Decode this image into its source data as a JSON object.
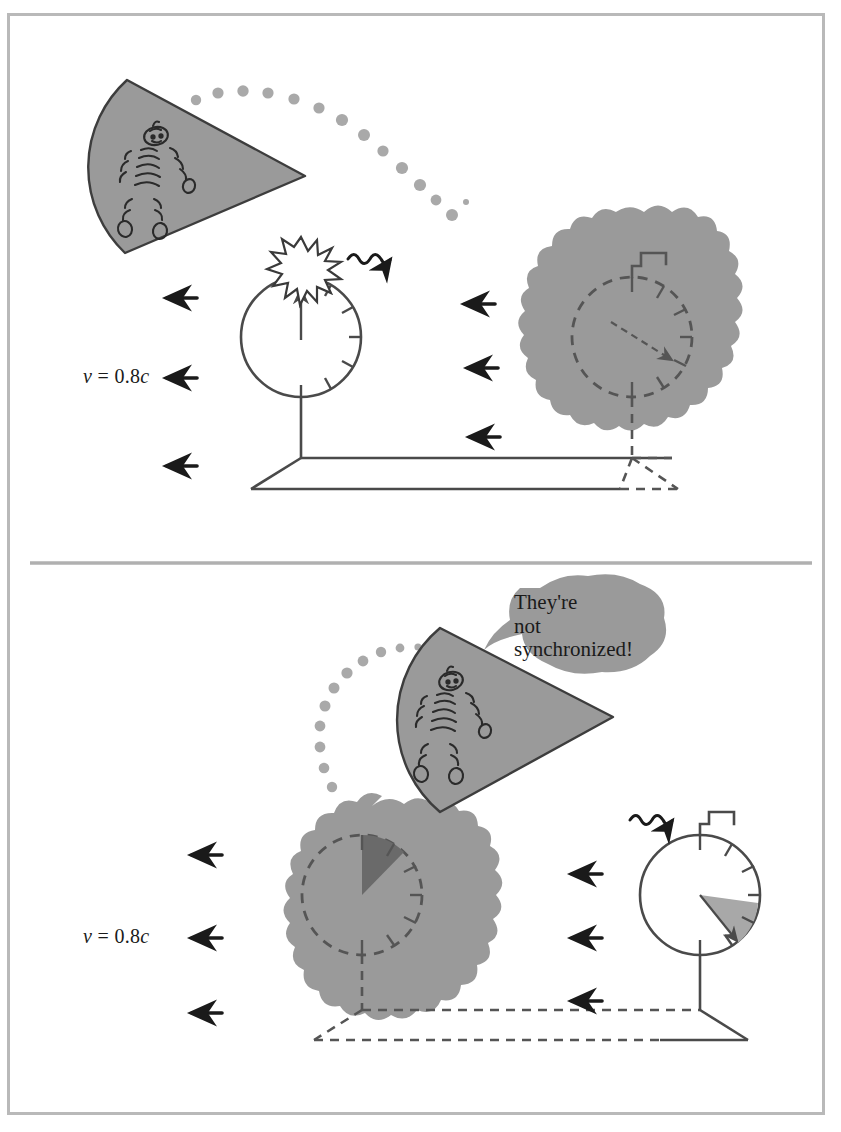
{
  "figure": {
    "panels": [
      {
        "id": "panel-top",
        "caption": "",
        "velocity_label": "v = 0.8c",
        "velocity_value": "0.8",
        "velocity_symbol_v": "v",
        "velocity_equals": "=",
        "velocity_symbol_c": "c",
        "left_clock": {
          "name": "near-clock",
          "style": "solid",
          "hand_angle_deg": 0,
          "hand_reading": "12 o'clock",
          "flash": true,
          "wave_emitted": true,
          "wedge": "none",
          "in_blob": false
        },
        "right_clock": {
          "name": "far-clock",
          "style": "dashed",
          "hand_angle_deg": 130,
          "hand_reading": "4 o'clock",
          "flash": false,
          "wave_emitted": false,
          "wedge": "none",
          "in_blob": true
        },
        "arrows_left": 3,
        "arrows_right": 3,
        "spaceship": {
          "position": "upper-left",
          "occupant": "alien"
        },
        "light_trail_dots": 13
      },
      {
        "id": "panel-bottom",
        "caption": "",
        "velocity_label": "v = 0.8c",
        "velocity_value": "0.8",
        "velocity_symbol_v": "v",
        "velocity_equals": "=",
        "velocity_symbol_c": "c",
        "left_clock": {
          "name": "far-clock",
          "style": "dashed",
          "hand_angle_deg": 28,
          "hand_reading": "1 o'clock",
          "flash": false,
          "wave_emitted": false,
          "wedge": "dark",
          "in_blob": true
        },
        "right_clock": {
          "name": "near-clock",
          "style": "solid",
          "hand_angle_deg": 130,
          "hand_reading": "4 o'clock",
          "flash": false,
          "wave_emitted": true,
          "wedge": "gray",
          "in_blob": false
        },
        "arrows_left": 3,
        "arrows_right": 3,
        "spaceship": {
          "position": "upper-middle",
          "occupant": "alien"
        },
        "light_trail_dots": 11,
        "speech_bubble": {
          "lines": [
            "They're",
            "not",
            "synchronized!"
          ],
          "line1": "They're",
          "line2": "not",
          "line3": "synchronized!"
        }
      }
    ]
  },
  "colors": {
    "frame_border": "#b9b9b9",
    "divider": "#b0b0b0",
    "ink": "#4a4a4a",
    "ink_dark": "#1a1a1a",
    "blob_gray": "#9a9a9a",
    "ship_gray": "#9a9a9a",
    "wedge_gray": "#a8a8a8",
    "wedge_dark": "#6a6a6a",
    "trail_dot": "#a9a9a9",
    "background": "#ffffff"
  },
  "icons": {
    "motion_arrow": "left-arrow-icon",
    "light_wave": "squiggle-wave-arrow-icon",
    "flash": "starburst-icon",
    "antenna": "antenna-flag-icon",
    "clock": "clock-face-icon",
    "spaceship": "cone-spaceship-icon",
    "alien": "alien-figure-icon",
    "trail": "dotted-trail-icon"
  }
}
